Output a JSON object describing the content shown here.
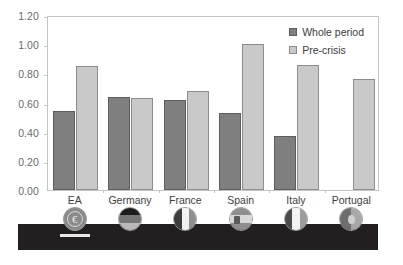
{
  "chart_data": {
    "type": "bar",
    "title": "",
    "subtitle": "",
    "xlabel": "",
    "ylabel": "",
    "ylim": [
      0.0,
      1.2
    ],
    "ytick_labels": [
      "0.00",
      "0.20",
      "0.40",
      "0.60",
      "0.80",
      "1.00",
      "1.20"
    ],
    "ytick_values": [
      0.0,
      0.2,
      0.4,
      0.6,
      0.8,
      1.0,
      1.2
    ],
    "grid": false,
    "legend_position": "top-right-inside",
    "categories": [
      "EA",
      "Germany",
      "France",
      "Spain",
      "Italy",
      "Portugal"
    ],
    "series": [
      {
        "name": "Whole period",
        "color": "#7f7f7f",
        "values": [
          0.54,
          0.64,
          0.62,
          0.53,
          0.37,
          null
        ]
      },
      {
        "name": "Pre-crisis",
        "color": "#c9c9c9",
        "values": [
          0.85,
          0.63,
          0.68,
          1.0,
          0.855,
          0.76
        ]
      }
    ],
    "annotations": []
  },
  "legend": {
    "items": [
      {
        "label": "Whole period",
        "swatch": "whole"
      },
      {
        "label": "Pre-crisis",
        "swatch": "pre"
      }
    ]
  },
  "icons": [
    {
      "name": "euro-coin-icon",
      "category": "EA"
    },
    {
      "name": "flag-germany-icon",
      "category": "Germany"
    },
    {
      "name": "flag-france-icon",
      "category": "France"
    },
    {
      "name": "flag-spain-icon",
      "category": "Spain"
    },
    {
      "name": "flag-italy-icon",
      "category": "Italy"
    },
    {
      "name": "flag-portugal-icon",
      "category": "Portugal"
    }
  ],
  "colors": {
    "whole_period_bar": "#7f7f7f",
    "pre_crisis_bar": "#c9c9c9",
    "bar_outline": "#5d5d5d",
    "plot_border": "#c4c4c4",
    "axis_text": "#6b6b6b",
    "label_text": "#3d3d3d",
    "dark_band": "#231f20",
    "background": "#ffffff"
  }
}
